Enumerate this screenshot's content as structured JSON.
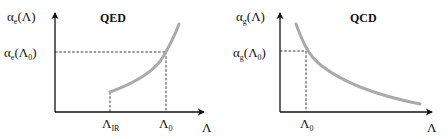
{
  "panels": [
    {
      "title": "QED",
      "y_label": {
        "symbol": "α",
        "subscript": "e",
        "arg": "(Λ)"
      },
      "y_ref_label": {
        "symbol": "α",
        "subscript": "e",
        "arg_open": "(Λ",
        "arg_sub": "0",
        "arg_close": ")"
      },
      "x_ticks": [
        {
          "symbol": "Λ",
          "subscript": "IR"
        },
        {
          "symbol": "Λ",
          "subscript": "0"
        }
      ],
      "x_label": "Λ",
      "curve": "increasing",
      "curve_color": "#aaaaaa"
    },
    {
      "title": "QCD",
      "y_label": {
        "symbol": "α",
        "subscript": "g",
        "arg": "(Λ)"
      },
      "y_ref_label": {
        "symbol": "α",
        "subscript": "g",
        "arg_open": "(Λ",
        "arg_sub": "0",
        "arg_close": ")"
      },
      "x_ticks": [
        {
          "symbol": "Λ",
          "subscript": "0"
        }
      ],
      "x_label": "Λ",
      "curve": "decreasing",
      "curve_color": "#aaaaaa"
    }
  ],
  "colors": {
    "axis": "#111111",
    "dashed": "#222222",
    "curve": "#aaaaaa"
  }
}
